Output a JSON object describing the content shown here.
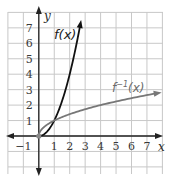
{
  "chart_data": {
    "type": "line",
    "title": "",
    "xlabel": "x",
    "ylabel": "y",
    "xlim": [
      -2,
      8
    ],
    "ylim": [
      -2,
      8.3
    ],
    "grid": true,
    "x_ticks": [
      "-1",
      "1",
      "2",
      "3",
      "4",
      "5",
      "6",
      "7"
    ],
    "y_ticks": [
      "1",
      "2",
      "3",
      "4",
      "5",
      "6",
      "7"
    ],
    "series": [
      {
        "name": "f(x)",
        "label": "f(x)",
        "color": "#111111",
        "function": "x^2, x >= 0",
        "points": [
          [
            0,
            0
          ],
          [
            0.5,
            0.25
          ],
          [
            1,
            1
          ],
          [
            1.5,
            2.25
          ],
          [
            2,
            4
          ],
          [
            2.5,
            6.25
          ],
          [
            2.75,
            7.56
          ]
        ]
      },
      {
        "name": "f^-1(x)",
        "label": "f⁻¹(x)",
        "color": "#777777",
        "function": "sqrt(x), x >= 0",
        "points": [
          [
            0,
            0
          ],
          [
            0.25,
            0.5
          ],
          [
            1,
            1
          ],
          [
            2,
            1.41
          ],
          [
            3,
            1.73
          ],
          [
            4,
            2
          ],
          [
            5,
            2.24
          ],
          [
            6,
            2.45
          ],
          [
            7,
            2.65
          ],
          [
            7.9,
            2.81
          ]
        ]
      }
    ],
    "annotations": [
      {
        "text": "f(x)",
        "x": 1.3,
        "y": 6.3
      },
      {
        "text": "f⁻¹(x)",
        "x": 4.8,
        "y": 3.0
      }
    ],
    "marked_point": [
      0,
      0
    ]
  },
  "labels": {
    "x_axis": "x",
    "y_axis": "y",
    "f": "f(x)",
    "finv_base": "f",
    "finv_sup": "−1",
    "finv_arg": "(x)"
  },
  "ticks": {
    "x": [
      {
        "v": -1,
        "t": "−1"
      },
      {
        "v": 1,
        "t": "1"
      },
      {
        "v": 2,
        "t": "2"
      },
      {
        "v": 3,
        "t": "3"
      },
      {
        "v": 4,
        "t": "4"
      },
      {
        "v": 5,
        "t": "5"
      },
      {
        "v": 6,
        "t": "6"
      },
      {
        "v": 7,
        "t": "7"
      }
    ],
    "y": [
      {
        "v": 1,
        "t": "1"
      },
      {
        "v": 2,
        "t": "2"
      },
      {
        "v": 3,
        "t": "3"
      },
      {
        "v": 4,
        "t": "4"
      },
      {
        "v": 5,
        "t": "5"
      },
      {
        "v": 6,
        "t": "6"
      },
      {
        "v": 7,
        "t": "7"
      }
    ]
  },
  "colors": {
    "grid": "#c8c8c8",
    "axis": "#222222",
    "f": "#111111",
    "finv": "#777777"
  }
}
